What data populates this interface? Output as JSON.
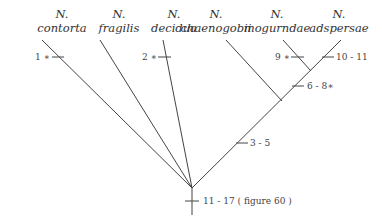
{
  "taxa": [
    {
      "genus": "N.",
      "species": "contorta"
    },
    {
      "genus": "N.",
      "species": "fragilis"
    },
    {
      "genus": "N.",
      "species": "decidua"
    },
    {
      "genus": "N.",
      "species": "chaenogobii"
    },
    {
      "genus": "N.",
      "species": "mogurndae"
    },
    {
      "genus": "N.",
      "species": "adspersae"
    }
  ],
  "characters": [
    {
      "id": "c1",
      "label": "1 ∗"
    },
    {
      "id": "c2",
      "label": "2 ∗"
    },
    {
      "id": "c9",
      "label": "9 ∗"
    },
    {
      "id": "c10",
      "label": "10 - 11"
    },
    {
      "id": "c6",
      "label": "6 - 8∗"
    },
    {
      "id": "c3",
      "label": "3 - 5"
    },
    {
      "id": "c11",
      "label": "11 - 17 ( figure 60 )"
    }
  ]
}
